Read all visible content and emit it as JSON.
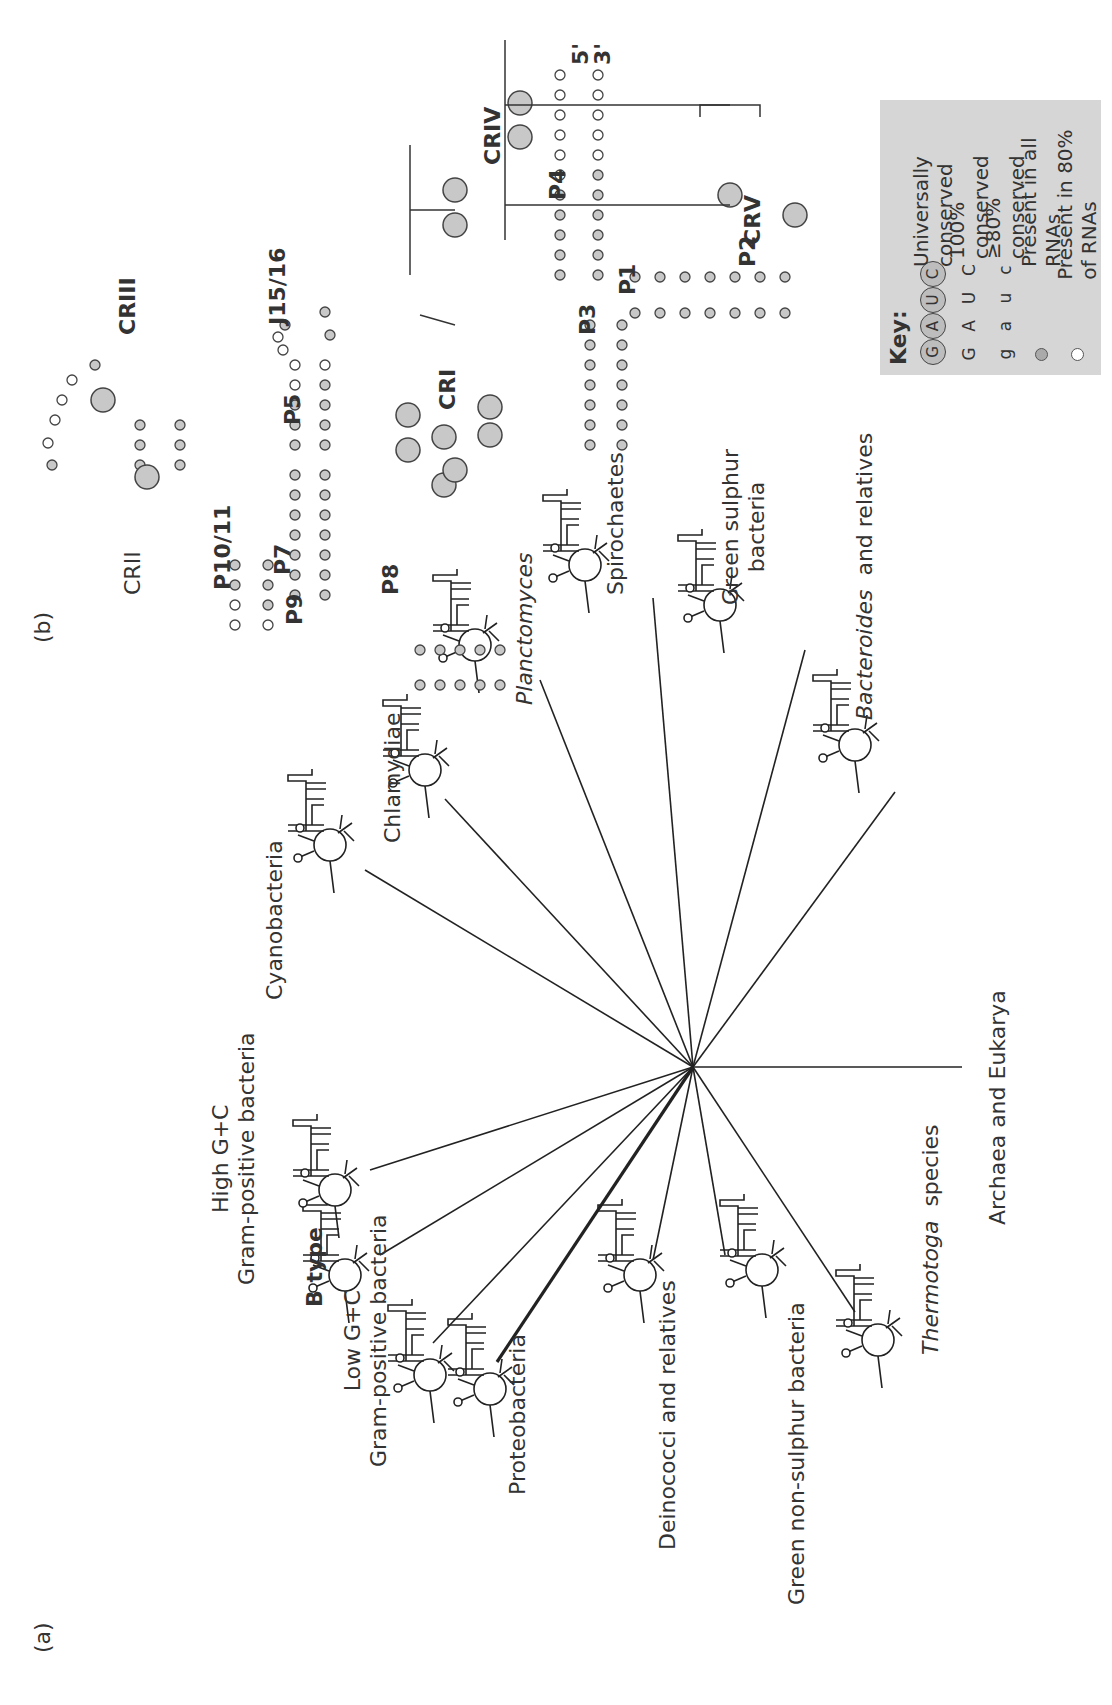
{
  "figure": {
    "orientation": "rotated 90° counter-clockwise on page",
    "panel_a": {
      "label": "(a)",
      "center": [
        638,
        693
      ],
      "taxa": [
        {
          "name": "Low G+C",
          "name2": "Gram-positive bacteria",
          "italic": false,
          "bold": false
        },
        {
          "name": "B type",
          "bold": true
        },
        {
          "name": "High G+C",
          "name2": "Gram-positive bacteria"
        },
        {
          "name": "Cyanobacteria"
        },
        {
          "name": "Chlamydiae"
        },
        {
          "name": "Planctomyces",
          "italic": true
        },
        {
          "name": "Spirochaetes"
        },
        {
          "name": "Green sulphur",
          "name2": "bacteria"
        },
        {
          "name_italic": "Bacteroides",
          "name_rest": "and relatives"
        },
        {
          "name": "Archaea and Eukarya"
        },
        {
          "name_italic": "Thermotoga",
          "name_rest": "species"
        },
        {
          "name": "Green non-sulphur bacteria"
        },
        {
          "name": "Deinococci and relatives"
        },
        {
          "name": "Proteobacteria"
        }
      ]
    },
    "panel_b": {
      "label": "(b)",
      "helix_labels": [
        "P1",
        "P2",
        "P3",
        "P4",
        "P5",
        "P7",
        "P8",
        "P9",
        "P10/11",
        "J15/16"
      ],
      "region_labels": [
        "CRI",
        "CRII",
        "CRIII",
        "CRIV",
        "CRV"
      ],
      "ends": [
        "5'",
        "3'"
      ],
      "key": {
        "title": "Key:",
        "rows": [
          {
            "symbol": [
              "G",
              "A",
              "U",
              "C"
            ],
            "type": "circled",
            "label": "Universally conserved"
          },
          {
            "symbol": [
              "G",
              "A",
              "U",
              "C"
            ],
            "type": "upper",
            "label": "100% conserved"
          },
          {
            "symbol": [
              "g",
              "a",
              "u",
              "c"
            ],
            "type": "lower",
            "label": "≥80% conserved"
          },
          {
            "symbol": [],
            "type": "filled-dot",
            "label": "Present in all RNAs"
          },
          {
            "symbol": [],
            "type": "open-dot",
            "label": "Present in 80% of RNAs"
          }
        ]
      }
    }
  }
}
